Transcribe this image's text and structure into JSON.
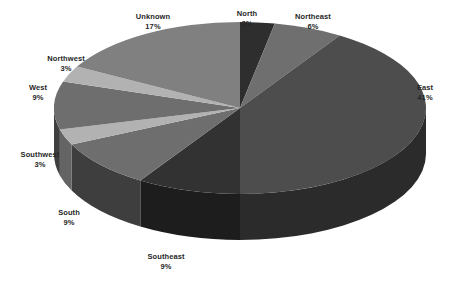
{
  "chart_data": {
    "type": "pie",
    "title": "",
    "subtitle": "",
    "xlabel": "",
    "ylabel": "",
    "legend_position": "none",
    "grid": false,
    "value_unit": "percent",
    "background_color": "#ffffff",
    "label_color": "#262626",
    "three_d": true,
    "start_angle_deg": 0,
    "direction": "clockwise",
    "categories": [
      "North",
      "Northeast",
      "East",
      "Southeast",
      "South",
      "Southwest",
      "West",
      "Northwest",
      "Unknown"
    ],
    "values": [
      3,
      6,
      41,
      9,
      9,
      3,
      9,
      3,
      17
    ],
    "slices": [
      {
        "label": "North",
        "value": 3,
        "percent_text": "3%",
        "color": "#2e2e2e",
        "side_color": "#1a1a1a",
        "label_x": 247,
        "label_y": 19
      },
      {
        "label": "Northeast",
        "value": 6,
        "percent_text": "6%",
        "color": "#6f6f6f",
        "side_color": "#3f3f3f",
        "label_x": 313,
        "label_y": 22
      },
      {
        "label": "East",
        "value": 41,
        "percent_text": "41%",
        "color": "#4d4d4d",
        "side_color": "#2b2b2b",
        "label_x": 425,
        "label_y": 93
      },
      {
        "label": "Southeast",
        "value": 9,
        "percent_text": "9%",
        "color": "#323232",
        "side_color": "#1d1d1d",
        "label_x": 166,
        "label_y": 262
      },
      {
        "label": "South",
        "value": 9,
        "percent_text": "9%",
        "color": "#6e6e6e",
        "side_color": "#3e3e3e",
        "label_x": 69,
        "label_y": 218
      },
      {
        "label": "Southwest",
        "value": 3,
        "percent_text": "3%",
        "color": "#b2b2b2",
        "side_color": "#646464",
        "label_x": 40,
        "label_y": 160
      },
      {
        "label": "West",
        "value": 9,
        "percent_text": "9%",
        "color": "#6e6e6e",
        "side_color": "#3e3e3e",
        "label_x": 38,
        "label_y": 93
      },
      {
        "label": "Northwest",
        "value": 3,
        "percent_text": "3%",
        "color": "#b2b2b2",
        "side_color": "#646464",
        "label_x": 66,
        "label_y": 64
      },
      {
        "label": "Unknown",
        "value": 17,
        "percent_text": "17%",
        "color": "#808080",
        "side_color": "#4a4a4a",
        "label_x": 153,
        "label_y": 22
      }
    ],
    "geometry": {
      "center_x": 240,
      "center_y": 108,
      "radius_x": 186,
      "radius_y": 86,
      "depth": 46
    }
  }
}
